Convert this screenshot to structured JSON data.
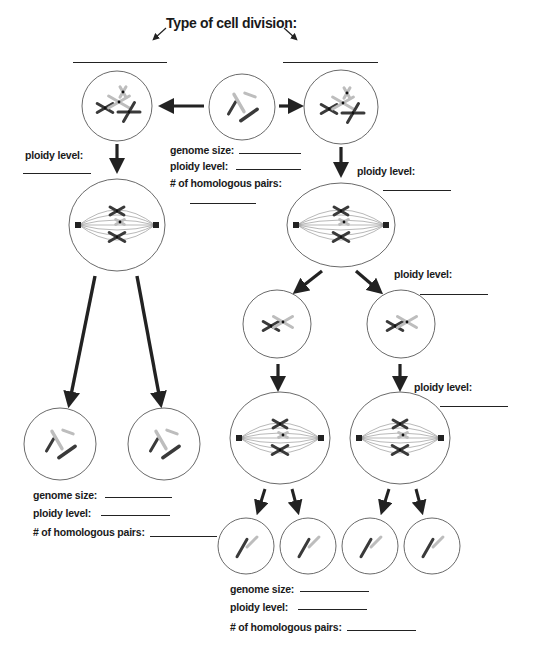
{
  "worksheet": {
    "title": "Type of cell division:",
    "colors": {
      "ink": "#222222",
      "dark_chrom": "#3a3a3a",
      "light_chrom": "#bdbdbd",
      "spindle": "#888888",
      "cell_outline": "#444444"
    },
    "top_answer_blanks": [
      {
        "id": "left-division-type-blank",
        "x": 73,
        "y": 62,
        "w": 94
      },
      {
        "id": "right-division-type-blank",
        "x": 283,
        "y": 62,
        "w": 95
      }
    ],
    "labels": [
      {
        "id": "parent-genome-size-label",
        "text": "genome size:",
        "x": 170,
        "y": 144,
        "blank": {
          "x": 239,
          "y": 153,
          "w": 62
        }
      },
      {
        "id": "parent-ploidy-label",
        "text": "ploidy level:",
        "x": 170,
        "y": 160,
        "blank": {
          "x": 236,
          "y": 169,
          "w": 65
        }
      },
      {
        "id": "parent-homologous-pairs-label",
        "text": "# of homologous pairs:",
        "x": 170,
        "y": 177,
        "blank": {
          "x": 190,
          "y": 203,
          "w": 66
        }
      },
      {
        "id": "mitosis-ploidy-label",
        "text": "ploidy level:",
        "x": 25,
        "y": 149,
        "blank": {
          "x": 23,
          "y": 173,
          "w": 68
        }
      },
      {
        "id": "meiosis1-ploidy-label",
        "text": "ploidy level:",
        "x": 357,
        "y": 165,
        "blank": {
          "x": 383,
          "y": 190,
          "w": 68
        }
      },
      {
        "id": "meiosis2-ploidy-label",
        "text": "ploidy level:",
        "x": 394,
        "y": 268,
        "blank": {
          "x": 420,
          "y": 294,
          "w": 68
        }
      },
      {
        "id": "meiosis2-metaphase-ploidy-label",
        "text": "ploidy level:",
        "x": 414,
        "y": 381,
        "blank": {
          "x": 440,
          "y": 406,
          "w": 68
        }
      },
      {
        "id": "mitosis-genome-size-label",
        "text": "genome size:",
        "x": 33,
        "y": 489,
        "blank": {
          "x": 105,
          "y": 497,
          "w": 67
        }
      },
      {
        "id": "mitosis-ploidy-result-label",
        "text": "ploidy level:",
        "x": 33,
        "y": 507,
        "blank": {
          "x": 101,
          "y": 515,
          "w": 69
        }
      },
      {
        "id": "mitosis-homologous-pairs-label",
        "text": "# of homologous pairs:",
        "x": 33,
        "y": 526,
        "blank": {
          "x": 150,
          "y": 536,
          "w": 67
        }
      },
      {
        "id": "meiosis-genome-size-label",
        "text": "genome size:",
        "x": 230,
        "y": 583,
        "blank": {
          "x": 300,
          "y": 591,
          "w": 69
        }
      },
      {
        "id": "meiosis-ploidy-result-label",
        "text": "ploidy level:",
        "x": 230,
        "y": 601,
        "blank": {
          "x": 298,
          "y": 609,
          "w": 69
        }
      },
      {
        "id": "meiosis-homologous-pairs-label",
        "text": "# of homologous pairs:",
        "x": 230,
        "y": 621,
        "blank": {
          "x": 347,
          "y": 630,
          "w": 69
        }
      }
    ],
    "cells": [
      {
        "id": "parent-cell",
        "stage": "interphase",
        "cx": 242,
        "cy": 107,
        "r": 33
      },
      {
        "id": "mitosis-prophase-cell",
        "stage": "prophase",
        "cx": 117,
        "cy": 106,
        "r": 35
      },
      {
        "id": "meiosis-prophase-cell",
        "stage": "prophase",
        "cx": 341,
        "cy": 107,
        "r": 37
      },
      {
        "id": "mitosis-metaphase-cell",
        "stage": "metaphase",
        "cx": 117,
        "cy": 225,
        "rx": 48,
        "ry": 46
      },
      {
        "id": "meiosis1-metaphase-cell",
        "stage": "metaphase",
        "cx": 341,
        "cy": 225,
        "rx": 54,
        "ry": 42
      },
      {
        "id": "meiosis1-daughter-left",
        "stage": "daughter",
        "cx": 277,
        "cy": 324,
        "r": 34
      },
      {
        "id": "meiosis1-daughter-right",
        "stage": "daughter",
        "cx": 401,
        "cy": 324,
        "r": 34
      },
      {
        "id": "mitosis-daughter-left",
        "stage": "daughter",
        "cx": 60,
        "cy": 444,
        "r": 36
      },
      {
        "id": "mitosis-daughter-right",
        "stage": "daughter",
        "cx": 164,
        "cy": 444,
        "r": 36
      },
      {
        "id": "meiosis2-metaphase-left",
        "stage": "metaphase",
        "cx": 280,
        "cy": 438,
        "rx": 50,
        "ry": 46
      },
      {
        "id": "meiosis2-metaphase-right",
        "stage": "metaphase",
        "cx": 400,
        "cy": 438,
        "rx": 50,
        "ry": 46
      },
      {
        "id": "gamete-1",
        "stage": "gamete",
        "cx": 246,
        "cy": 546,
        "r": 28
      },
      {
        "id": "gamete-2",
        "stage": "gamete",
        "cx": 308,
        "cy": 546,
        "r": 28
      },
      {
        "id": "gamete-3",
        "stage": "gamete",
        "cx": 370,
        "cy": 546,
        "r": 28
      },
      {
        "id": "gamete-4",
        "stage": "gamete",
        "cx": 432,
        "cy": 546,
        "r": 28
      }
    ]
  }
}
